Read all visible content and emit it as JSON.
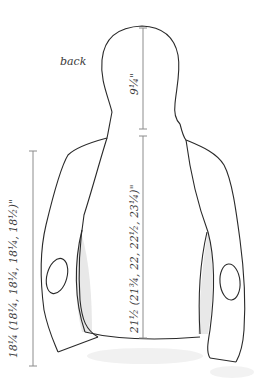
{
  "diagram": {
    "view_label": "back",
    "measurements": {
      "hood_height": "9¼\"",
      "body_length": "21½ (21¾, 22, 22½, 23¼)\"",
      "sleeve_length": "18¼ (18¼, 18¼, 18¼, 18½)\""
    },
    "colors": {
      "outline": "#2a2a2a",
      "measure_line": "#8c8c8c",
      "shading": "#d9d9d9",
      "text": "#3a3a3a"
    }
  }
}
